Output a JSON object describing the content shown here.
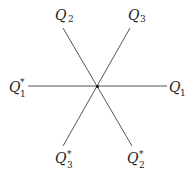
{
  "diagram": {
    "type": "star-of-vectors",
    "center": {
      "x": 97,
      "y": 86
    },
    "line_color": "#555555",
    "labels": [
      {
        "id": "Q1",
        "main": "Q",
        "sub": "1",
        "sup": ""
      },
      {
        "id": "Q1star",
        "main": "Q",
        "sub": "1",
        "sup": "*"
      },
      {
        "id": "Q2",
        "main": "Q",
        "sub": "2",
        "sup": ""
      },
      {
        "id": "Q2star",
        "main": "Q",
        "sub": "2",
        "sup": "*"
      },
      {
        "id": "Q3",
        "main": "Q",
        "sub": "3",
        "sup": ""
      },
      {
        "id": "Q3star",
        "main": "Q",
        "sub": "3",
        "sup": "*"
      }
    ]
  }
}
